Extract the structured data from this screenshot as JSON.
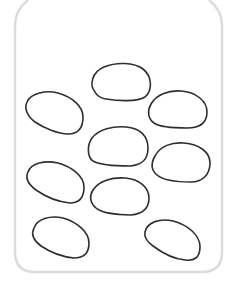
{
  "scene": {
    "description": "Line drawing of a jar containing stones",
    "background_color": "#ffffff",
    "jar": {
      "stroke_color": "#dcdcdc",
      "left_x": 14,
      "right_x": 222,
      "bottom_y": 272
    },
    "stone_stroke_color": "#2e2e2e",
    "stone_count": 9,
    "stones": [
      {
        "id": "top-center",
        "x1": 92,
        "y1": 63,
        "x2": 151,
        "y2": 101
      },
      {
        "id": "left-upper",
        "x1": 24,
        "y1": 91,
        "x2": 83,
        "y2": 134
      },
      {
        "id": "right-upper",
        "x1": 148,
        "y1": 90,
        "x2": 208,
        "y2": 128
      },
      {
        "id": "center",
        "x1": 88,
        "y1": 126,
        "x2": 148,
        "y2": 166
      },
      {
        "id": "right-middle",
        "x1": 151,
        "y1": 142,
        "x2": 210,
        "y2": 182
      },
      {
        "id": "left-middle",
        "x1": 26,
        "y1": 161,
        "x2": 85,
        "y2": 203
      },
      {
        "id": "center-lower",
        "x1": 90,
        "y1": 178,
        "x2": 150,
        "y2": 215
      },
      {
        "id": "left-bottom",
        "x1": 32,
        "y1": 216,
        "x2": 90,
        "y2": 258
      },
      {
        "id": "right-bottom",
        "x1": 144,
        "y1": 219,
        "x2": 201,
        "y2": 261
      }
    ]
  }
}
